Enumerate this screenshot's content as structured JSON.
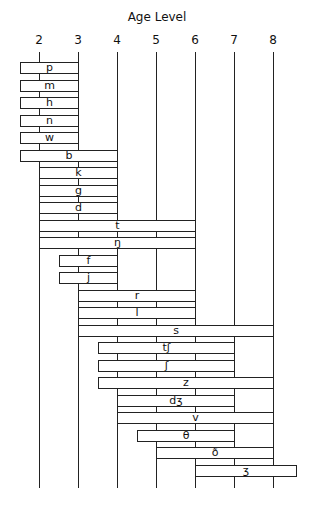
{
  "chart_data": {
    "type": "bar",
    "orientation": "horizontal-range",
    "title": "Age Level",
    "xlabel": "Age Level",
    "ylabel": "",
    "xlim": [
      1.5,
      8.6
    ],
    "x_ticks": [
      2,
      3,
      4,
      5,
      6,
      7,
      8
    ],
    "grid": "vertical lines at each integer age",
    "legend": null,
    "categories": [
      "p",
      "m",
      "h",
      "n",
      "w",
      "b",
      "k",
      "g",
      "d",
      "t",
      "ŋ",
      "f",
      "j",
      "r",
      "l",
      "s",
      "tʃ",
      "ʃ",
      "z",
      "dʒ",
      "v",
      "θ",
      "ð",
      "ʒ"
    ],
    "series": [
      {
        "name": "Age range of acquisition",
        "ranges": [
          {
            "label": "p",
            "start": 1.5,
            "end": 3
          },
          {
            "label": "m",
            "start": 1.5,
            "end": 3
          },
          {
            "label": "h",
            "start": 1.5,
            "end": 3
          },
          {
            "label": "n",
            "start": 1.5,
            "end": 3
          },
          {
            "label": "w",
            "start": 1.5,
            "end": 3
          },
          {
            "label": "b",
            "start": 1.5,
            "end": 4
          },
          {
            "label": "k",
            "start": 2,
            "end": 4
          },
          {
            "label": "g",
            "start": 2,
            "end": 4
          },
          {
            "label": "d",
            "start": 2,
            "end": 4
          },
          {
            "label": "t",
            "start": 2,
            "end": 6
          },
          {
            "label": "ŋ",
            "start": 2,
            "end": 6
          },
          {
            "label": "f",
            "start": 2.5,
            "end": 4
          },
          {
            "label": "j",
            "start": 2.5,
            "end": 4
          },
          {
            "label": "r",
            "start": 3,
            "end": 6
          },
          {
            "label": "l",
            "start": 3,
            "end": 6
          },
          {
            "label": "s",
            "start": 3,
            "end": 8
          },
          {
            "label": "tʃ",
            "start": 3.5,
            "end": 7
          },
          {
            "label": "ʃ",
            "start": 3.5,
            "end": 7
          },
          {
            "label": "z",
            "start": 3.5,
            "end": 8
          },
          {
            "label": "dʒ",
            "start": 4,
            "end": 7
          },
          {
            "label": "v",
            "start": 4,
            "end": 8
          },
          {
            "label": "θ",
            "start": 4.5,
            "end": 7
          },
          {
            "label": "ð",
            "start": 5,
            "end": 8
          },
          {
            "label": "ʒ",
            "start": 6,
            "end": 8.6
          }
        ]
      }
    ]
  },
  "colors": {
    "background": "#ffffff",
    "lines": "#222222",
    "bar_fill": "#ffffff"
  }
}
